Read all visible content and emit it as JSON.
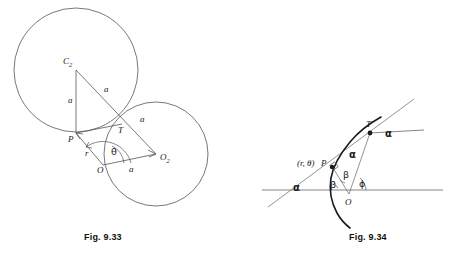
{
  "page": {
    "background": "#ffffff",
    "ink": "#1a1a1a",
    "line_color": "#555555",
    "width": 451,
    "height": 257
  },
  "figures": [
    {
      "id": "fig-9-33",
      "caption": "Fig. 9.33",
      "description": "Two equal circles of radius a, centers C2 and C1, intersecting at T; pole O on circle C1 with polar point P on circle C2.",
      "shapes": {
        "circle_c2": {
          "cx": 76,
          "cy": 70,
          "r": 62,
          "label": "C",
          "subscript": "2"
        },
        "circle_c1": {
          "cx": 156,
          "cy": 154,
          "r": 52,
          "label": "C",
          "subscript": "1"
        }
      },
      "points": [
        {
          "name": "C2",
          "label": "C",
          "subscript": "2",
          "x": 76,
          "y": 70
        },
        {
          "name": "C1",
          "label": "C",
          "subscript": "1",
          "x": 156,
          "y": 154
        },
        {
          "name": "T",
          "label": "T",
          "x": 122,
          "y": 124
        },
        {
          "name": "P",
          "label": "P",
          "x": 76,
          "y": 133
        },
        {
          "name": "O",
          "label": "O",
          "x": 103,
          "y": 165
        }
      ],
      "segment_labels": [
        {
          "name": "c2-p",
          "text": "a",
          "x": 68,
          "y": 103
        },
        {
          "name": "c2-c1",
          "text": "a",
          "x": 104,
          "y": 92
        },
        {
          "name": "t-c1",
          "text": "a",
          "x": 140,
          "y": 122
        },
        {
          "name": "o-c1",
          "text": "a",
          "x": 129,
          "y": 172
        }
      ],
      "angle_labels": [
        {
          "name": "radius-r",
          "text": "r",
          "x": 87,
          "y": 154
        },
        {
          "name": "angle-theta",
          "text": "θ",
          "x": 114,
          "y": 152
        }
      ]
    },
    {
      "id": "fig-9-34",
      "caption": "Fig. 9.34",
      "description": "Equiangular spiral through T and P with tangent line, initial line through O, angles alpha, beta and phi marked.",
      "points": [
        {
          "name": "T",
          "label": "T",
          "x": 370,
          "y": 133
        },
        {
          "name": "P",
          "label": "P",
          "x": 332,
          "y": 167
        },
        {
          "name": "O",
          "label": "O",
          "x": 349,
          "y": 197
        }
      ],
      "labels": [
        {
          "name": "polar-coords",
          "text": "(r, θ)",
          "x": 300,
          "y": 164
        },
        {
          "name": "point-p",
          "text": "P",
          "x": 324,
          "y": 164
        },
        {
          "name": "point-t",
          "text": "T",
          "x": 367,
          "y": 126
        },
        {
          "name": "point-o",
          "text": "O",
          "x": 349,
          "y": 204
        },
        {
          "name": "alpha-at-t",
          "text": "α",
          "x": 388,
          "y": 135
        },
        {
          "name": "alpha-mid",
          "text": "α",
          "x": 352,
          "y": 155
        },
        {
          "name": "alpha-left",
          "text": "α",
          "x": 296,
          "y": 188
        },
        {
          "name": "beta-inner",
          "text": "β",
          "x": 345,
          "y": 176
        },
        {
          "name": "beta-outer",
          "text": "β",
          "x": 332,
          "y": 186
        },
        {
          "name": "phi",
          "text": "ϕ",
          "x": 362,
          "y": 184
        }
      ]
    }
  ]
}
